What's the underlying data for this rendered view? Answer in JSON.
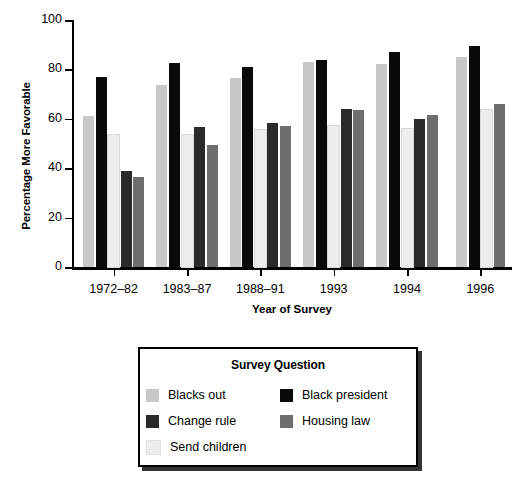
{
  "chart_data": {
    "type": "bar",
    "title": "",
    "xlabel": "Year of Survey",
    "ylabel": "Percentage More Favorable",
    "ylim": [
      0,
      100
    ],
    "yticks": [
      0,
      20,
      40,
      60,
      80,
      100
    ],
    "grid": false,
    "legend_position": "below-plot",
    "legend_title": "Survey Question",
    "categories": [
      "1972–82",
      "1983–87",
      "1988–91",
      "1993",
      "1994",
      "1996"
    ],
    "series": [
      {
        "name": "Blacks out",
        "color": "#c8c8c8",
        "values": [
          61,
          73.5,
          76.5,
          83,
          82,
          85
        ]
      },
      {
        "name": "Black president",
        "color": "#0a0a0a",
        "values": [
          77,
          82.5,
          81,
          84,
          87,
          89.5
        ]
      },
      {
        "name": "Send children",
        "color": "#ededed",
        "values": [
          53.5,
          53.5,
          55.5,
          57,
          56,
          63.5
        ]
      },
      {
        "name": "Change rule",
        "color": "#2a2a2a",
        "values": [
          39,
          56.5,
          58.5,
          64,
          60,
          null
        ]
      },
      {
        "name": "Housing law",
        "color": "#6e6e6e",
        "values": [
          36.5,
          49.5,
          57,
          63.5,
          61.5,
          66
        ]
      }
    ]
  },
  "legend": {
    "title": "Survey Question",
    "entries": [
      {
        "label": "Blacks out",
        "color": "#c8c8c8"
      },
      {
        "label": "Black president",
        "color": "#0a0a0a"
      },
      {
        "label": "Change rule",
        "color": "#2a2a2a"
      },
      {
        "label": "Housing law",
        "color": "#6e6e6e"
      },
      {
        "label": "Send children",
        "color": "#ededed"
      }
    ]
  },
  "axis": {
    "ytick_labels": [
      "100",
      "80",
      "60",
      "40",
      "20",
      "0"
    ],
    "xtick_labels": [
      "1972–82",
      "1983–87",
      "1988–91",
      "1993",
      "1994",
      "1996"
    ]
  }
}
